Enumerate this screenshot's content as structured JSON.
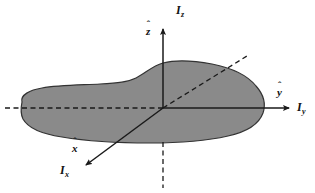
{
  "figure": {
    "background_color": "#ffffff",
    "width": 315,
    "height": 193
  },
  "body_shape": {
    "name": "rigid-body-blob",
    "fill_color": "#8a8a8a",
    "stroke_color": "#333333",
    "stroke_width": 1.2,
    "description": "irregular shaded rigid body outline"
  },
  "origin": {
    "x": 163,
    "y": 108
  },
  "axes": [
    {
      "id": "z",
      "principal_label": "I",
      "principal_subscript": "z",
      "unit_label": "z",
      "unit_hat": "ˆ",
      "direction": "up",
      "solid_from": {
        "x": 163,
        "y": 108
      },
      "solid_to": {
        "x": 163,
        "y": 26
      },
      "dashed_from": {
        "x": 163,
        "y": 138
      },
      "dashed_to": {
        "x": 163,
        "y": 188
      },
      "arrowhead": true,
      "color": "#1a1a1a"
    },
    {
      "id": "y",
      "principal_label": "I",
      "principal_subscript": "y",
      "unit_label": "y",
      "unit_hat": "ˆ",
      "direction": "right",
      "solid_from": {
        "x": 163,
        "y": 108
      },
      "solid_to": {
        "x": 292,
        "y": 108
      },
      "dashed_from": {
        "x": 5,
        "y": 108
      },
      "dashed_to": {
        "x": 163,
        "y": 108
      },
      "arrowhead": true,
      "color": "#1a1a1a"
    },
    {
      "id": "x",
      "principal_label": "I",
      "principal_subscript": "x",
      "unit_label": "x",
      "unit_hat": "ˆ",
      "direction": "down-left",
      "solid_from": {
        "x": 163,
        "y": 108
      },
      "solid_to": {
        "x": 83,
        "y": 167
      },
      "dashed_from": {
        "x": 163,
        "y": 108
      },
      "dashed_to": {
        "x": 247,
        "y": 56
      },
      "arrowhead": true,
      "color": "#1a1a1a"
    }
  ],
  "labels": {
    "Iz": {
      "base": "I",
      "sub": "z"
    },
    "zhat": {
      "base": "z",
      "hat": "ˆ"
    },
    "Iy": {
      "base": "I",
      "sub": "y"
    },
    "yhat": {
      "base": "y",
      "hat": "ˆ"
    },
    "Ix": {
      "base": "I",
      "sub": "x"
    },
    "xhat": {
      "base": "x",
      "hat": "ˆ"
    }
  },
  "colors": {
    "blob_fill": "#8a8a8a",
    "blob_stroke": "#333333",
    "axis": "#1a1a1a",
    "background": "#ffffff",
    "text": "#111111"
  }
}
